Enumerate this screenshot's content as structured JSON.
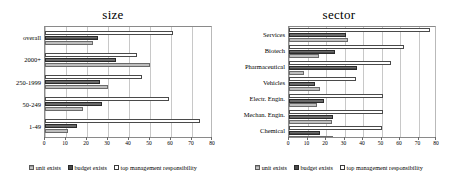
{
  "figure": {
    "panels": [
      {
        "id": "size",
        "title": "size",
        "chart_data": {
          "type": "bar",
          "orientation": "horizontal",
          "title": "size",
          "xlabel": "",
          "ylabel": "",
          "xlim": [
            0,
            80
          ],
          "xticks": [
            0,
            10,
            20,
            30,
            40,
            50,
            60,
            70,
            80
          ],
          "grid": true,
          "legend_position": "bottom",
          "categories": [
            "overall",
            "2000+",
            "250-1999",
            "50-249",
            "1-49"
          ],
          "series": [
            {
              "name": "unit exists",
              "values": [
                23,
                50,
                30,
                18,
                11
              ]
            },
            {
              "name": "budget exists",
              "values": [
                25,
                34,
                26,
                27,
                15
              ]
            },
            {
              "name": "top management responsibility",
              "values": [
                61,
                44,
                46,
                59,
                74
              ]
            }
          ]
        }
      },
      {
        "id": "sector",
        "title": "sector",
        "chart_data": {
          "type": "bar",
          "orientation": "horizontal",
          "title": "sector",
          "xlabel": "",
          "ylabel": "",
          "xlim": [
            0,
            80
          ],
          "xticks": [
            0,
            10,
            20,
            30,
            40,
            50,
            60,
            70,
            80
          ],
          "grid": true,
          "legend_position": "bottom",
          "categories": [
            "Services",
            "Biotech",
            "Pharmaceutical",
            "Vehicles",
            "Electr. Engin.",
            "Mechan. Engin.",
            "Chemical"
          ],
          "series": [
            {
              "name": "unit exists",
              "values": [
                32,
                16,
                8,
                17,
                15,
                23,
                24
              ]
            },
            {
              "name": "budget exists",
              "values": [
                31,
                25,
                37,
                14,
                19,
                24,
                17
              ]
            },
            {
              "name": "top management responsibility",
              "values": [
                76,
                62,
                55,
                36,
                51,
                51,
                50
              ]
            }
          ]
        }
      }
    ],
    "legend": [
      {
        "key": "unit",
        "label": "unit exists"
      },
      {
        "key": "budget",
        "label": "budget exists"
      },
      {
        "key": "top",
        "label": "top management responsibility"
      }
    ],
    "colors": {
      "unit_exists": "#9a9a9a",
      "budget_exists": "#4c4c4c",
      "top_management": "#ffffff",
      "gridline": "#c8c8c8",
      "axis": "#8a8a8a",
      "text": "#000000"
    }
  }
}
